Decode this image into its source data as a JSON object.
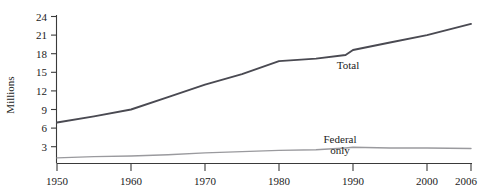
{
  "chart_data": {
    "type": "line",
    "title": "",
    "xlabel": "",
    "ylabel": "Millions",
    "ylim": [
      0,
      24
    ],
    "xlim": [
      1950,
      2006
    ],
    "grid": false,
    "legend_position": "inline-annotations",
    "y_ticks": [
      "3",
      "6",
      "9",
      "12",
      "15",
      "18",
      "21",
      "24"
    ],
    "y_tick_values": [
      3,
      6,
      9,
      12,
      15,
      18,
      21,
      24
    ],
    "x_ticks": [
      "1950",
      "1960",
      "1970",
      "1980",
      "1990",
      "2000",
      "2006"
    ],
    "x_tick_values": [
      1950,
      1960,
      1970,
      1980,
      1990,
      2000,
      2006
    ],
    "x": [
      1950,
      1955,
      1960,
      1965,
      1970,
      1975,
      1980,
      1985,
      1989,
      1990,
      1995,
      2000,
      2006
    ],
    "series": [
      {
        "name": "Total",
        "color": "#4a4a52",
        "values": [
          6.9,
          7.9,
          9.0,
          11.0,
          13.0,
          14.7,
          16.8,
          17.2,
          17.8,
          18.6,
          19.8,
          21.0,
          22.8
        ]
      },
      {
        "name": "Federal only",
        "color": "#9a9a9e",
        "values": [
          1.2,
          1.4,
          1.5,
          1.7,
          2.0,
          2.2,
          2.4,
          2.5,
          2.8,
          2.9,
          2.8,
          2.8,
          2.7
        ]
      }
    ],
    "annotations": [
      {
        "name": "total-label",
        "text": "Total",
        "lines": [
          "Total"
        ]
      },
      {
        "name": "federal-only-label",
        "text": "Federal only",
        "lines": [
          "Federal",
          "only"
        ]
      }
    ]
  }
}
